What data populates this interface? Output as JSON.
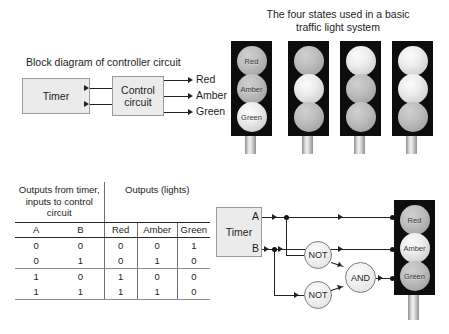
{
  "block_diagram": {
    "caption": "Block diagram of controller circuit",
    "timer_label": "Timer",
    "control_label_line1": "Control",
    "control_label_line2": "circuit",
    "outputs": [
      "Red",
      "Amber",
      "Green"
    ]
  },
  "states_panel": {
    "heading_line1": "The four states used in a basic",
    "heading_line2": "traffic light system",
    "lamp_labels": [
      "Red",
      "Amber",
      "Green"
    ],
    "states": [
      {
        "red": "off",
        "amber": "off",
        "green": "on",
        "labeled": true
      },
      {
        "red": "off",
        "amber": "on",
        "green": "off",
        "labeled": false
      },
      {
        "red": "on",
        "amber": "off",
        "green": "off",
        "labeled": false
      },
      {
        "red": "on",
        "amber": "on",
        "green": "off",
        "labeled": false
      }
    ]
  },
  "truth_table": {
    "group_inputs": "Outputs from timer, inputs to control circuit",
    "group_outputs": "Outputs (lights)",
    "columns": [
      "A",
      "B",
      "Red",
      "Amber",
      "Green"
    ],
    "rows": [
      [
        "0",
        "0",
        "0",
        "0",
        "1"
      ],
      [
        "0",
        "1",
        "0",
        "1",
        "0"
      ],
      [
        "1",
        "0",
        "1",
        "0",
        "0"
      ],
      [
        "1",
        "1",
        "1",
        "1",
        "0"
      ]
    ]
  },
  "logic_circuit": {
    "timer_label": "Timer",
    "input_a": "A",
    "input_b": "B",
    "gate_not_1": "NOT",
    "gate_not_2": "NOT",
    "gate_and": "AND",
    "lamp_labels": [
      "Red",
      "Amber",
      "Green"
    ]
  },
  "colors": {
    "housing": "#0d0d0d",
    "block_fill": "#ebebeb",
    "wire": "#222222",
    "text": "#1d1d1d"
  }
}
